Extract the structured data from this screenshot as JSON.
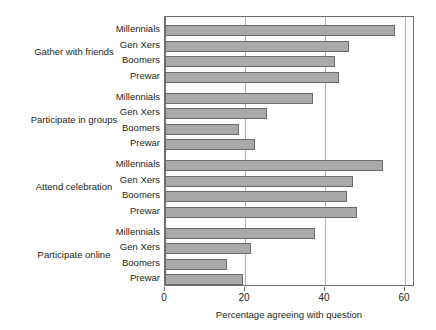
{
  "chart_data": {
    "type": "bar",
    "orientation": "horizontal",
    "title": "",
    "xlabel": "Percentage agreeing with question",
    "ylabel": "",
    "xlim": [
      0,
      60
    ],
    "xticks": [
      0,
      20,
      40,
      60
    ],
    "xtick_labels": [
      "0",
      "20",
      "40",
      "60"
    ],
    "grid": "vertical",
    "legend": "none",
    "bar_color": "#a9a9a9",
    "bar_edge_color": "#6b6b6b",
    "axis_color": "#6f6f6f",
    "gridline_color": "#b3b3b3",
    "groups": [
      {
        "label": "Gather with friends",
        "categories": [
          "Millennials",
          "Gen Xers",
          "Boomers",
          "Prewar"
        ],
        "values": [
          57.5,
          46,
          42.5,
          43.5
        ]
      },
      {
        "label": "Participate in groups",
        "categories": [
          "Millennials",
          "Gen Xers",
          "Boomers",
          "Prewar"
        ],
        "values": [
          37,
          25.5,
          18.5,
          22.5
        ]
      },
      {
        "label": "Attend celebration",
        "categories": [
          "Millennials",
          "Gen Xers",
          "Boomers",
          "Prewar"
        ],
        "values": [
          54.5,
          47,
          45.5,
          48
        ]
      },
      {
        "label": "Participate online",
        "categories": [
          "Millennials",
          "Gen Xers",
          "Boomers",
          "Prewar"
        ],
        "values": [
          37.5,
          21.5,
          15.5,
          19.5
        ]
      }
    ]
  }
}
